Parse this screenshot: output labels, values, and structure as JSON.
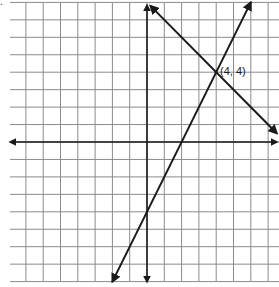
{
  "chart_data": {
    "type": "line",
    "title": "",
    "xlabel": "",
    "ylabel": "",
    "grid": true,
    "xlim": [
      -8,
      7.5
    ],
    "ylim": [
      -8,
      8
    ],
    "grid_step": 1,
    "series": [
      {
        "name": "line-decreasing",
        "equation": "y = -x + 8",
        "slope": -1,
        "intercept": 8,
        "x": [
          0.2,
          7.5
        ],
        "y": [
          7.8,
          0.5
        ]
      },
      {
        "name": "line-increasing",
        "equation": "y = 2x - 4",
        "slope": 2,
        "intercept": -4,
        "x": [
          -2,
          6
        ],
        "y": [
          -8,
          8
        ]
      }
    ],
    "annotations": [
      {
        "text": "(4, 4)",
        "x": 4,
        "y": 4
      }
    ]
  },
  "corner_mark": ".",
  "intersection_label": "(4, 4)",
  "colors": {
    "grid": "#8a8a8a",
    "axis": "#1a1a1a",
    "line": "#1a1a1a",
    "background": "#ffffff"
  }
}
